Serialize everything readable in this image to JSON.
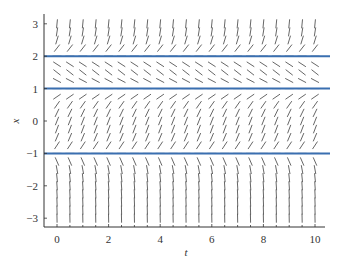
{
  "chart_data": {
    "type": "slope_field",
    "title": "",
    "xlabel": "t",
    "ylabel": "x",
    "xlim": [
      -0.5,
      10.4
    ],
    "ylim": [
      -3.3,
      3.3
    ],
    "xticks": [
      0,
      2,
      4,
      6,
      8,
      10
    ],
    "xtick_labels": [
      "0",
      "2",
      "4",
      "6",
      "8",
      "10"
    ],
    "yticks": [
      3,
      2,
      1,
      0,
      -1,
      -2,
      -3
    ],
    "ytick_labels": [
      "3",
      "2",
      "1",
      "0",
      "−1",
      "−2",
      "−3"
    ],
    "minor_xticks_step": 0.5,
    "grid": false,
    "ode": "dx/dt = (x+1)(x-1)(x-2)",
    "slope_field": {
      "t_start": 0,
      "t_end": 10,
      "t_step": 0.5,
      "x_start": -3,
      "x_end": 3,
      "x_step": 0.25,
      "segment_color": "#555555"
    },
    "series": [
      {
        "name": "equilibrium x=2",
        "type": "hline",
        "y": 2,
        "color": "#3a6fb0"
      },
      {
        "name": "equilibrium x=1",
        "type": "hline",
        "y": 1,
        "color": "#3a6fb0"
      },
      {
        "name": "equilibrium x=-1",
        "type": "hline",
        "y": -1,
        "color": "#3a6fb0"
      }
    ]
  }
}
